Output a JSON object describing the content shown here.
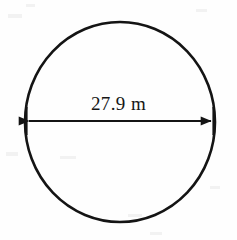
{
  "figure": {
    "type": "geometry-diagram",
    "shape": "circle",
    "background_color": "#fefefe",
    "stroke_color": "#141414",
    "canvas": {
      "width": 237,
      "height": 240
    },
    "circle": {
      "name": "circle-outline",
      "center_x": 120,
      "center_y": 122,
      "radius_x": 95,
      "radius_y": 100,
      "stroke_width": 2.6
    },
    "dimension": {
      "name": "diameter",
      "label": "27.9 m",
      "value": 27.9,
      "unit": "m",
      "orientation": "horizontal",
      "line_y": 121,
      "start_x": 26,
      "end_x": 214,
      "arrowheads": "both",
      "label_x": 120,
      "label_y": 94
    }
  }
}
